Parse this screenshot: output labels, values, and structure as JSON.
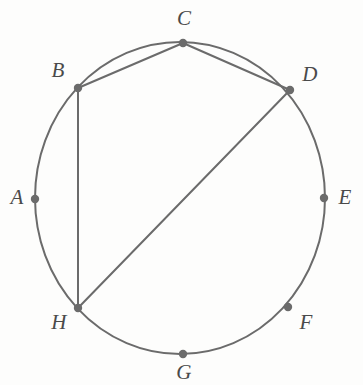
{
  "figure": {
    "type": "geometry-diagram",
    "canvas": {
      "width": 363,
      "height": 385,
      "background": "#fdfdfc"
    },
    "style": {
      "stroke_color": "#6b6b6b",
      "stroke_width": 2.0,
      "point_color": "#6b6b6b",
      "point_radius": 4.2,
      "label_color": "#4a4a4a",
      "label_font_size": 21,
      "label_style": "italic-serif"
    },
    "circle": {
      "name": "main-circle",
      "center_x": 180,
      "center_y": 198,
      "radius_x": 145,
      "radius_y": 156
    },
    "points": [
      {
        "id": "A",
        "label": "A",
        "x": 35,
        "y": 199,
        "label_x": 17,
        "label_y": 199
      },
      {
        "id": "B",
        "label": "B",
        "x": 78,
        "y": 88,
        "label_x": 58,
        "label_y": 72
      },
      {
        "id": "C",
        "label": "C",
        "x": 183,
        "y": 43,
        "label_x": 184,
        "label_y": 20
      },
      {
        "id": "D",
        "label": "D",
        "x": 290,
        "y": 90,
        "label_x": 310,
        "label_y": 76
      },
      {
        "id": "E",
        "label": "E",
        "x": 324,
        "y": 198,
        "label_x": 345,
        "label_y": 199
      },
      {
        "id": "F",
        "label": "F",
        "x": 288,
        "y": 307,
        "label_x": 306,
        "label_y": 324
      },
      {
        "id": "G",
        "label": "G",
        "x": 183,
        "y": 354,
        "label_x": 184,
        "label_y": 374
      },
      {
        "id": "H",
        "label": "H",
        "x": 78,
        "y": 308,
        "label_x": 59,
        "label_y": 324
      }
    ],
    "chords": [
      {
        "name": "chord-bc",
        "from": "B",
        "to": "C",
        "x1": 78,
        "y1": 88,
        "x2": 183,
        "y2": 43
      },
      {
        "name": "chord-cd",
        "from": "C",
        "to": "D",
        "x1": 183,
        "y1": 43,
        "x2": 290,
        "y2": 90
      },
      {
        "name": "chord-bh",
        "from": "B",
        "to": "H",
        "x1": 78,
        "y1": 88,
        "x2": 78,
        "y2": 308
      },
      {
        "name": "chord-dh",
        "from": "D",
        "to": "H",
        "x1": 290,
        "y1": 90,
        "x2": 78,
        "y2": 308
      }
    ]
  }
}
